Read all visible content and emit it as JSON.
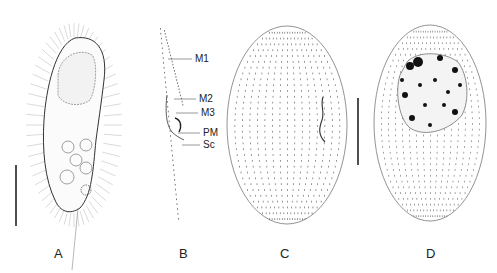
{
  "figure": {
    "panels": [
      {
        "id": "A",
        "label": "A",
        "x": 54,
        "description": "ciliate-in-vivo"
      },
      {
        "id": "B",
        "label": "B",
        "x": 179,
        "description": "oral-region-detail"
      },
      {
        "id": "C",
        "label": "C",
        "x": 280,
        "description": "ventral-infraciliature"
      },
      {
        "id": "D",
        "label": "D",
        "x": 426,
        "description": "dorsal-infraciliature-macronucleus"
      }
    ],
    "panel_b_labels": [
      {
        "text": "M1",
        "y": 54,
        "line_x1": 168,
        "line_x2": 192
      },
      {
        "text": "M2",
        "y": 94,
        "line_x1": 174,
        "line_x2": 196
      },
      {
        "text": "M3",
        "y": 108,
        "line_x1": 176,
        "line_x2": 198
      },
      {
        "text": "PM",
        "y": 128,
        "line_x1": 178,
        "line_x2": 200
      },
      {
        "text": "Sc",
        "y": 140,
        "line_x1": 182,
        "line_x2": 200
      }
    ],
    "scale_bars": [
      {
        "panel": "A",
        "x": 16,
        "y1": 165,
        "y2": 226
      },
      {
        "panel": "C",
        "x": 358,
        "y1": 98,
        "y2": 165
      }
    ],
    "colors": {
      "ink": "#333333",
      "light_ink": "#9a9a9a",
      "background": "#ffffff"
    }
  }
}
